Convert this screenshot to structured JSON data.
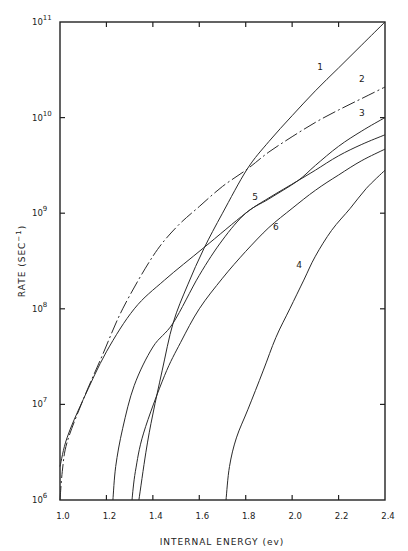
{
  "chart_data": {
    "type": "line",
    "title": "",
    "xlabel": "INTERNAL ENERGY (ev)",
    "ylabel": "RATE (SEC",
    "ylabel_sup": "−1",
    "ylabel_close": ")",
    "xlim": [
      1.0,
      2.4
    ],
    "ylim_log10": [
      6,
      11
    ],
    "yscale": "log",
    "grid": false,
    "legend": "inline curve labels",
    "x_ticks": [
      "1.0",
      "1.2",
      "1.4",
      "1.6",
      "1.8",
      "2.0",
      "2.2",
      "2.4"
    ],
    "x_tick_values": [
      1.0,
      1.2,
      1.4,
      1.6,
      1.8,
      2.0,
      2.2,
      2.4
    ],
    "y_ticks": [
      {
        "base": "10",
        "exp": "6",
        "log": 6
      },
      {
        "base": "10",
        "exp": "7",
        "log": 7
      },
      {
        "base": "10",
        "exp": "8",
        "log": 8
      },
      {
        "base": "10",
        "exp": "9",
        "log": 9
      },
      {
        "base": "10",
        "exp": "10",
        "log": 10
      },
      {
        "base": "10",
        "exp": "11",
        "log": 11
      }
    ],
    "series": [
      {
        "name": "1",
        "style": "solid",
        "points": [
          [
            1.34,
            6.0
          ],
          [
            1.37,
            6.5
          ],
          [
            1.4,
            6.9
          ],
          [
            1.44,
            7.35
          ],
          [
            1.487,
            7.85
          ],
          [
            1.55,
            8.25
          ],
          [
            1.62,
            8.63
          ],
          [
            1.7,
            9.0
          ],
          [
            1.806,
            9.46
          ],
          [
            1.9,
            9.75
          ],
          [
            2.0,
            10.02
          ],
          [
            2.1,
            10.28
          ],
          [
            2.2,
            10.52
          ],
          [
            2.3,
            10.76
          ],
          [
            2.4,
            11.0
          ]
        ],
        "label_pos": [
          2.12,
          10.5
        ]
      },
      {
        "name": "2",
        "style": "dashed",
        "points": [
          [
            1.0,
            6.0
          ],
          [
            1.01,
            6.3
          ],
          [
            1.03,
            6.6
          ],
          [
            1.1,
            7.05
          ],
          [
            1.18,
            7.5
          ],
          [
            1.27,
            8.0
          ],
          [
            1.4,
            8.55
          ],
          [
            1.5,
            8.85
          ],
          [
            1.6,
            9.07
          ],
          [
            1.7,
            9.28
          ],
          [
            1.806,
            9.46
          ],
          [
            1.9,
            9.64
          ],
          [
            2.0,
            9.8
          ],
          [
            2.1,
            9.95
          ],
          [
            2.2,
            10.08
          ],
          [
            2.3,
            10.2
          ],
          [
            2.4,
            10.32
          ]
        ],
        "label_pos": [
          2.3,
          10.37
        ]
      },
      {
        "name": "3",
        "style": "solid",
        "points": [
          [
            1.228,
            6.0
          ],
          [
            1.24,
            6.35
          ],
          [
            1.27,
            6.75
          ],
          [
            1.32,
            7.2
          ],
          [
            1.4,
            7.6
          ],
          [
            1.487,
            7.85
          ],
          [
            1.6,
            8.35
          ],
          [
            1.7,
            8.72
          ],
          [
            1.8,
            9.0
          ],
          [
            1.9,
            9.15
          ],
          [
            2.025,
            9.34
          ],
          [
            2.1,
            9.5
          ],
          [
            2.2,
            9.7
          ],
          [
            2.3,
            9.86
          ],
          [
            2.4,
            10.0
          ]
        ],
        "label_pos": [
          2.3,
          10.02
        ]
      },
      {
        "name": "4",
        "style": "solid",
        "points": [
          [
            1.715,
            6.0
          ],
          [
            1.73,
            6.35
          ],
          [
            1.76,
            6.65
          ],
          [
            1.81,
            6.95
          ],
          [
            1.875,
            7.35
          ],
          [
            1.93,
            7.7
          ],
          [
            1.99,
            8.0
          ],
          [
            2.05,
            8.3
          ],
          [
            2.1,
            8.55
          ],
          [
            2.17,
            8.82
          ],
          [
            2.25,
            9.05
          ],
          [
            2.32,
            9.26
          ],
          [
            2.4,
            9.45
          ]
        ],
        "label_pos": [
          2.03,
          8.43
        ]
      },
      {
        "name": "5",
        "style": "solid",
        "points": [
          [
            1.0,
            6.35
          ],
          [
            1.03,
            6.65
          ],
          [
            1.1,
            7.05
          ],
          [
            1.2,
            7.55
          ],
          [
            1.32,
            8.0
          ],
          [
            1.45,
            8.3
          ],
          [
            1.62,
            8.64
          ],
          [
            1.8,
            9.0
          ],
          [
            1.9,
            9.16
          ],
          [
            2.025,
            9.34
          ],
          [
            2.1,
            9.45
          ],
          [
            2.2,
            9.6
          ],
          [
            2.3,
            9.72
          ],
          [
            2.4,
            9.82
          ]
        ],
        "label_pos": [
          1.84,
          9.14
        ]
      },
      {
        "name": "6",
        "style": "solid",
        "points": [
          [
            1.31,
            6.0
          ],
          [
            1.325,
            6.3
          ],
          [
            1.36,
            6.7
          ],
          [
            1.45,
            7.3
          ],
          [
            1.52,
            7.65
          ],
          [
            1.6,
            8.0
          ],
          [
            1.7,
            8.32
          ],
          [
            1.8,
            8.6
          ],
          [
            1.9,
            8.85
          ],
          [
            2.0,
            9.05
          ],
          [
            2.1,
            9.24
          ],
          [
            2.2,
            9.4
          ],
          [
            2.3,
            9.55
          ],
          [
            2.4,
            9.67
          ]
        ],
        "label_pos": [
          1.93,
          8.82
        ]
      }
    ]
  },
  "plot_frame": {
    "left": 60,
    "right": 385,
    "top": 22,
    "bottom": 500
  },
  "colors": {
    "ink": "#222222",
    "background": "#ffffff"
  }
}
